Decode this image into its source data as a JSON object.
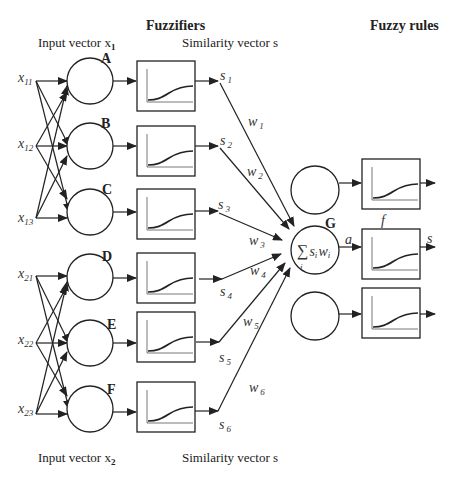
{
  "headers": {
    "fuzzifiers": "Fuzzifiers",
    "fuzzy_rules": "Fuzzy rules"
  },
  "captions": {
    "input_vector_1": "Input vector x",
    "input_vector_1_sub": "1",
    "input_vector_2": "Input vector x",
    "input_vector_2_sub": "2",
    "similarity_top": "Similarity vector s",
    "similarity_bottom": "Similarity vector s"
  },
  "inputs": [
    {
      "base": "x",
      "sub": "11"
    },
    {
      "base": "x",
      "sub": "12"
    },
    {
      "base": "x",
      "sub": "13"
    },
    {
      "base": "x",
      "sub": "21"
    },
    {
      "base": "x",
      "sub": "22"
    },
    {
      "base": "x",
      "sub": "23"
    }
  ],
  "fuzzifier_nodes": [
    "A",
    "B",
    "C",
    "D",
    "E",
    "F"
  ],
  "similarities": [
    {
      "base": "s",
      "sub": "1"
    },
    {
      "base": "s",
      "sub": "2"
    },
    {
      "base": "s",
      "sub": "3"
    },
    {
      "base": "s",
      "sub": "4"
    },
    {
      "base": "s",
      "sub": "5"
    },
    {
      "base": "s",
      "sub": "6"
    }
  ],
  "weights": [
    {
      "base": "w",
      "sub": "1"
    },
    {
      "base": "w",
      "sub": "2"
    },
    {
      "base": "w",
      "sub": "3"
    },
    {
      "base": "w",
      "sub": "4"
    },
    {
      "base": "w",
      "sub": "5"
    },
    {
      "base": "w",
      "sub": "6"
    }
  ],
  "rule_node": {
    "label": "G",
    "formula_sigma": "∑",
    "formula_body": "s",
    "formula_sub_s": "i",
    "formula_w": "w",
    "formula_sub_w": "i",
    "formula_index": "i",
    "activation_label": "a",
    "function_label": "f",
    "output_label": "s"
  }
}
